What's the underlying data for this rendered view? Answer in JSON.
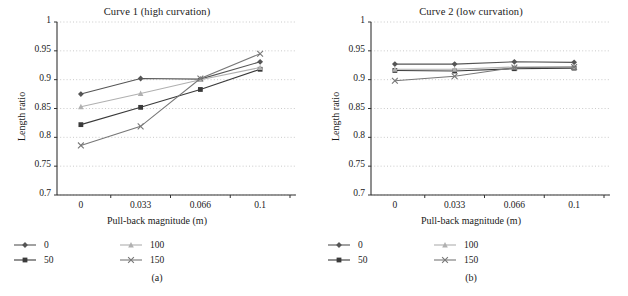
{
  "figure": {
    "width": 628,
    "height": 296,
    "background": "#ffffff"
  },
  "panels": [
    {
      "id": "a",
      "subcaption": "(a)",
      "chart_data": {
        "type": "line",
        "title": "Curve 1 (high curvation)",
        "xlabel": "Pull-back magnitude (m)",
        "ylabel": "Length ratio",
        "categories": [
          "0",
          "0.033",
          "0.066",
          "0.1"
        ],
        "x": [
          0,
          0.033,
          0.066,
          0.1
        ],
        "ylim": [
          0.7,
          1
        ],
        "yticks": [
          0.7,
          0.75,
          0.8,
          0.85,
          0.9,
          0.95,
          1
        ],
        "ytick_labels": [
          "0.7",
          "0.75",
          "0.8",
          "0.85",
          "0.9",
          "0.95",
          "1"
        ],
        "grid": "horizontal-dotted",
        "legend_position": "below",
        "series": [
          {
            "name": "0",
            "marker": "diamond",
            "color": "#555555",
            "values": [
              0.875,
              0.902,
              0.901,
              0.931
            ]
          },
          {
            "name": "50",
            "marker": "square",
            "color": "#3a3a3a",
            "values": [
              0.822,
              0.852,
              0.883,
              0.918
            ]
          },
          {
            "name": "100",
            "marker": "triangle",
            "color": "#b0b0b0",
            "values": [
              0.853,
              0.876,
              0.9,
              0.921
            ]
          },
          {
            "name": "150",
            "marker": "cross",
            "color": "#777777",
            "values": [
              0.786,
              0.819,
              0.902,
              0.945
            ]
          }
        ]
      }
    },
    {
      "id": "b",
      "subcaption": "(b)",
      "chart_data": {
        "type": "line",
        "title": "Curve 2 (low curvation)",
        "xlabel": "Pull-back magnitude (m)",
        "ylabel": "Length ratio",
        "categories": [
          "0",
          "0.033",
          "0.066",
          "0.1"
        ],
        "x": [
          0,
          0.033,
          0.066,
          0.1
        ],
        "ylim": [
          0.7,
          1
        ],
        "yticks": [
          0.7,
          0.75,
          0.8,
          0.85,
          0.9,
          0.95,
          1
        ],
        "ytick_labels": [
          "0.7",
          "0.75",
          "0.8",
          "0.85",
          "0.9",
          "0.95",
          "1"
        ],
        "grid": "horizontal-dotted",
        "legend_position": "below",
        "series": [
          {
            "name": "0",
            "marker": "diamond",
            "color": "#555555",
            "values": [
              0.927,
              0.927,
              0.931,
              0.93
            ]
          },
          {
            "name": "50",
            "marker": "square",
            "color": "#3a3a3a",
            "values": [
              0.916,
              0.915,
              0.919,
              0.92
            ]
          },
          {
            "name": "100",
            "marker": "triangle",
            "color": "#b0b0b0",
            "values": [
              0.918,
              0.918,
              0.922,
              0.922
            ]
          },
          {
            "name": "150",
            "marker": "cross",
            "color": "#777777",
            "values": [
              0.898,
              0.906,
              0.921,
              0.922
            ]
          }
        ]
      }
    }
  ],
  "legend_entries": [
    {
      "label": "0",
      "marker": "diamond"
    },
    {
      "label": "50",
      "marker": "square"
    },
    {
      "label": "100",
      "marker": "triangle"
    },
    {
      "label": "150",
      "marker": "cross"
    }
  ]
}
